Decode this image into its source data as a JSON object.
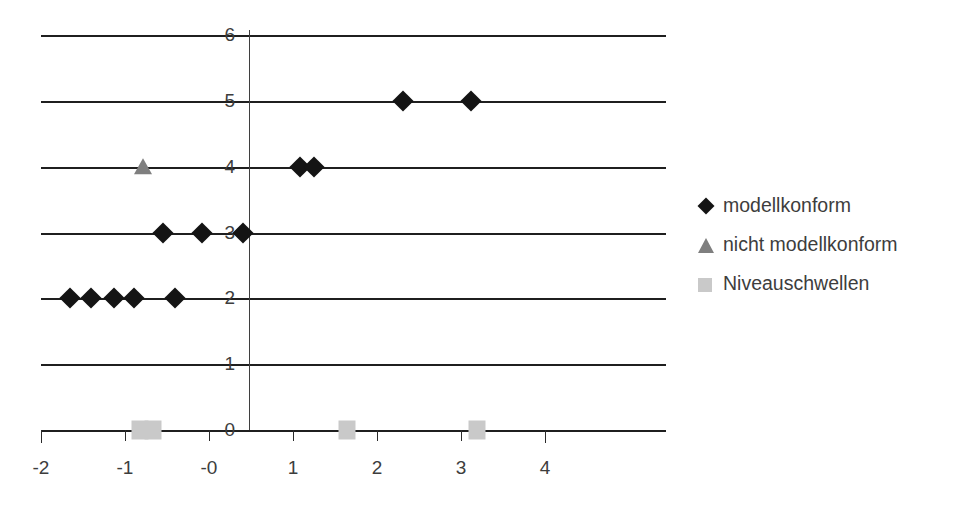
{
  "chart_data": {
    "type": "scatter",
    "title": "",
    "xlabel": "",
    "ylabel": "",
    "xlim": [
      -2,
      4
    ],
    "ylim": [
      0,
      6
    ],
    "grid": "horizontal",
    "legend_position": "right",
    "x_ticks": [
      "-2",
      "-1",
      "-0",
      "1",
      "2",
      "3",
      "4"
    ],
    "x_tick_values": [
      -2,
      -1,
      0,
      1,
      2,
      3,
      4
    ],
    "y_ticks": [
      "0",
      "1",
      "2",
      "3",
      "4",
      "5",
      "6"
    ],
    "y_tick_values": [
      0,
      1,
      2,
      3,
      4,
      5,
      6
    ],
    "series": [
      {
        "name": "modellkonform",
        "marker": "diamond",
        "color": "#141414",
        "points": [
          {
            "x": -1.65,
            "y": 2
          },
          {
            "x": -1.4,
            "y": 2
          },
          {
            "x": -1.13,
            "y": 2
          },
          {
            "x": -0.89,
            "y": 2
          },
          {
            "x": -0.41,
            "y": 2
          },
          {
            "x": -0.55,
            "y": 3
          },
          {
            "x": -0.08,
            "y": 3
          },
          {
            "x": 0.4,
            "y": 3
          },
          {
            "x": 1.08,
            "y": 4
          },
          {
            "x": 1.25,
            "y": 4
          },
          {
            "x": 2.31,
            "y": 5
          },
          {
            "x": 3.12,
            "y": 5
          }
        ]
      },
      {
        "name": "nicht modellkonform",
        "marker": "triangle",
        "color": "#7f7f7f",
        "points": [
          {
            "x": -0.78,
            "y": 4
          }
        ]
      },
      {
        "name": "Niveauschwellen",
        "marker": "square",
        "color": "#c9c9c9",
        "points": [
          {
            "x": -0.82,
            "y": 0
          },
          {
            "x": -0.67,
            "y": 0
          },
          {
            "x": 1.64,
            "y": 0
          },
          {
            "x": 3.19,
            "y": 0
          }
        ]
      }
    ]
  },
  "legend": {
    "items": [
      {
        "label": "modellkonform",
        "marker": "diamond"
      },
      {
        "label": "nicht modellkonform",
        "marker": "triangle"
      },
      {
        "label": "Niveauschwellen",
        "marker": "square"
      }
    ]
  },
  "colors": {
    "conform": "#141414",
    "non_conform": "#7f7f7f",
    "threshold": "#c9c9c9",
    "axis": "#1f1f1f",
    "text": "#3d3d3d",
    "background": "#ffffff"
  }
}
